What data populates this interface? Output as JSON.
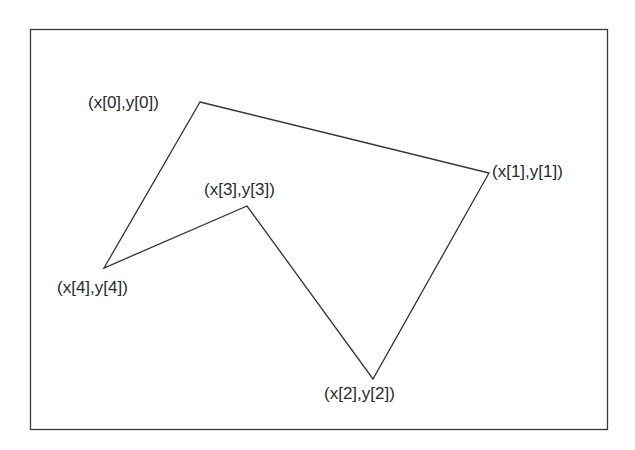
{
  "diagram": {
    "type": "polygon",
    "frame": {
      "x": 30,
      "y": 29,
      "width": 577,
      "height": 400
    },
    "stroke_color": "#333333",
    "vertices": [
      {
        "id": 0,
        "label": "(x[0],y[0])",
        "x": 200,
        "y": 102,
        "label_x": 88,
        "label_y": 108
      },
      {
        "id": 1,
        "label": "(x[1],y[1])",
        "x": 489,
        "y": 173,
        "label_x": 492,
        "label_y": 177
      },
      {
        "id": 2,
        "label": "(x[2],y[2])",
        "x": 373,
        "y": 379,
        "label_x": 324,
        "label_y": 399
      },
      {
        "id": 3,
        "label": "(x[3],y[3])",
        "x": 247,
        "y": 206,
        "label_x": 204,
        "label_y": 195
      },
      {
        "id": 4,
        "label": "(x[4],y[4])",
        "x": 104,
        "y": 268,
        "label_x": 57,
        "label_y": 293
      }
    ]
  }
}
